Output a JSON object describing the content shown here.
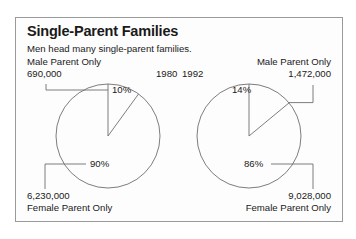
{
  "header": {
    "title": "Single-Parent Families",
    "subtitle": "Men head many single-parent families."
  },
  "chart_data": {
    "type": "pie",
    "title": "Single-Parent Families",
    "subtitle": "Men head many single-parent families.",
    "xlabel": "",
    "ylabel": "",
    "grid": false,
    "legend": "none",
    "charts": [
      {
        "year": "1980",
        "slices": [
          {
            "label": "Male Parent Only",
            "percent": 10,
            "percent_label": "10%",
            "count": "690,000"
          },
          {
            "label": "Female Parent Only",
            "percent": 90,
            "percent_label": "90%",
            "count": "6,230,000"
          }
        ]
      },
      {
        "year": "1992",
        "slices": [
          {
            "label": "Male Parent Only",
            "percent": 14,
            "percent_label": "14%",
            "count": "1,472,000"
          },
          {
            "label": "Female Parent Only",
            "percent": 86,
            "percent_label": "86%",
            "count": "9,028,000"
          }
        ]
      }
    ]
  },
  "left": {
    "year": "1980",
    "male_label": "Male Parent Only",
    "male_count": "690,000",
    "male_pct": "10%",
    "female_count": "6,230,000",
    "female_label": "Female Parent Only",
    "female_pct": "90%"
  },
  "right": {
    "year": "1992",
    "male_label": "Male Parent Only",
    "male_count": "1,472,000",
    "male_pct": "14%",
    "female_count": "9,028,000",
    "female_label": "Female Parent Only",
    "female_pct": "86%"
  },
  "colors": {
    "frame": "#9a9a9a",
    "stroke": "#6e6e6e",
    "text": "#1a1a1a",
    "background": "#fdfdfd"
  }
}
